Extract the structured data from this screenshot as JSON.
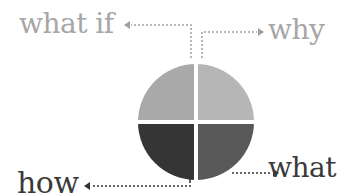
{
  "diagram": {
    "labels": {
      "what_if": "what if",
      "why": "why",
      "what": "what",
      "how": "how"
    },
    "quadrants": [
      {
        "position": "top-left",
        "label_ref": "what if",
        "color": "#a9a9a9"
      },
      {
        "position": "top-right",
        "label_ref": "why",
        "color": "#b6b6b6"
      },
      {
        "position": "bottom-right",
        "label_ref": "what",
        "color": "#595959"
      },
      {
        "position": "bottom-left",
        "label_ref": "how",
        "color": "#353535"
      }
    ],
    "colors": {
      "light_text": "#a6a6a6",
      "dark_text": "#3a3a3a",
      "light_connector": "#a0a0a0",
      "dark_connector": "#333333"
    }
  }
}
